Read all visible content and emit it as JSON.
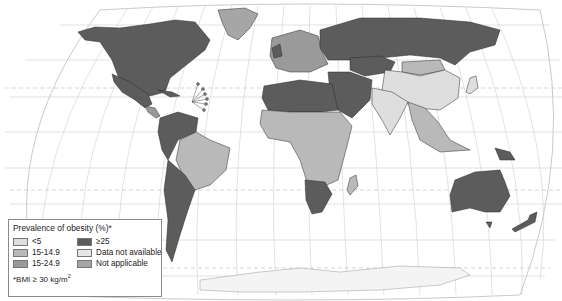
{
  "map": {
    "projection": "Robinson-like world projection",
    "longitude_ticks": [
      "180°",
      "160°",
      "140°",
      "120°",
      "100°",
      "80°",
      "60°",
      "40°",
      "20°",
      "0°",
      "20°",
      "40°",
      "60°",
      "80°",
      "100°",
      "120°",
      "140°",
      "160°",
      "180°"
    ],
    "latitude_ticks": [
      "80°",
      "60°",
      "40°",
      "20°",
      "0°",
      "20°",
      "40°",
      "60°",
      "80°"
    ],
    "colors": {
      "lt5": "#dedede",
      "c15_14_9": "#b9b9b9",
      "c15_24_9": "#9a9a9a",
      "gte25": "#5c5c5c",
      "no_data": "#e6e6e6",
      "not_applicable": "#a6a6a6",
      "ocean": "#ffffff",
      "graticule": "#c8c8c8",
      "border": "#333333"
    },
    "regions": [
      {
        "name": "North America (USA/Canada)",
        "category": "≥25"
      },
      {
        "name": "Mexico",
        "category": "≥25"
      },
      {
        "name": "Greenland",
        "category": "Not applicable"
      },
      {
        "name": "Central America",
        "category": "15-24.9"
      },
      {
        "name": "Northwestern South America",
        "category": "≥25"
      },
      {
        "name": "Brazil",
        "category": "15-14.9"
      },
      {
        "name": "Southern Cone (Argentina/Chile)",
        "category": "≥25"
      },
      {
        "name": "Russia",
        "category": "≥25"
      },
      {
        "name": "Europe",
        "category": "15-24.9"
      },
      {
        "name": "North Africa",
        "category": "≥25"
      },
      {
        "name": "Middle East",
        "category": "≥25"
      },
      {
        "name": "Sub-Saharan Africa",
        "category": "15-14.9"
      },
      {
        "name": "Southern Africa",
        "category": "≥25"
      },
      {
        "name": "Madagascar",
        "category": "15-14.9"
      },
      {
        "name": "China",
        "category": "<5"
      },
      {
        "name": "Mongolia",
        "category": "15-14.9"
      },
      {
        "name": "Kazakhstan",
        "category": "≥25"
      },
      {
        "name": "India",
        "category": "<5"
      },
      {
        "name": "Southeast Asia",
        "category": "15-14.9"
      },
      {
        "name": "Papua New Guinea",
        "category": "≥25"
      },
      {
        "name": "Australia",
        "category": "≥25"
      },
      {
        "name": "New Zealand",
        "category": "≥25"
      },
      {
        "name": "Antarctica",
        "category": "Data not available"
      }
    ]
  },
  "legend": {
    "title": "Prevalence of obesity (%)*",
    "items": [
      {
        "label": "<5",
        "color": "#dedede"
      },
      {
        "label": "≥25",
        "color": "#5c5c5c"
      },
      {
        "label": "15-14.9",
        "color": "#b9b9b9"
      },
      {
        "label": "Data not available",
        "color": "#e6e6e6"
      },
      {
        "label": "15-24.9",
        "color": "#9a9a9a"
      },
      {
        "label": "Not applicable",
        "color": "#a6a6a6"
      }
    ],
    "note_prefix": "*BMI ≥ 30 kg/m",
    "note_sup": "2"
  }
}
